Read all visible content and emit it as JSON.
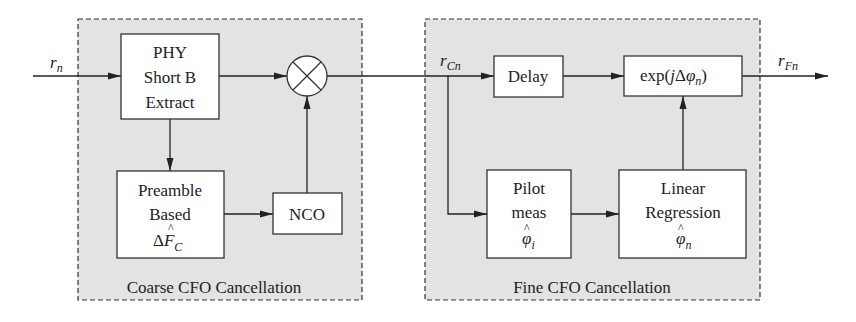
{
  "colors": {
    "region_fill": "#e3e3e3",
    "region_border": "#333333",
    "block_fill": "#ffffff",
    "line": "#222222",
    "text": "#222222"
  },
  "signals": {
    "input": {
      "base": "r",
      "sub": "n"
    },
    "coarse_output": {
      "base": "r",
      "sub": "Cn"
    },
    "output": {
      "base": "r",
      "sub": "Fn"
    }
  },
  "regions": {
    "coarse": {
      "label": "Coarse CFO Cancellation"
    },
    "fine": {
      "label": "Fine CFO Cancellation"
    }
  },
  "blocks": {
    "phy": {
      "lines": [
        "PHY",
        "Short B",
        "Extract"
      ]
    },
    "preamble": {
      "lines": [
        "Preamble",
        "Based"
      ],
      "symbol": {
        "prefix": "Δ",
        "base": "F",
        "hat": "^",
        "sub": "C"
      }
    },
    "nco": {
      "label": "NCO"
    },
    "multiplier": {
      "symbol": "⊗"
    },
    "delay": {
      "label": "Delay"
    },
    "exp": {
      "prefix": "exp(",
      "j": "j",
      "delta": "Δ",
      "phi": "φ",
      "sub": "n",
      "suffix": ")"
    },
    "pilot": {
      "lines": [
        "Pilot",
        "meas"
      ],
      "symbol": {
        "base": "φ",
        "hat": "^",
        "sub": "i"
      }
    },
    "linreg": {
      "lines": [
        "Linear",
        "Regression"
      ],
      "symbol": {
        "base": "φ",
        "hat": "^",
        "sub": "n"
      }
    }
  }
}
